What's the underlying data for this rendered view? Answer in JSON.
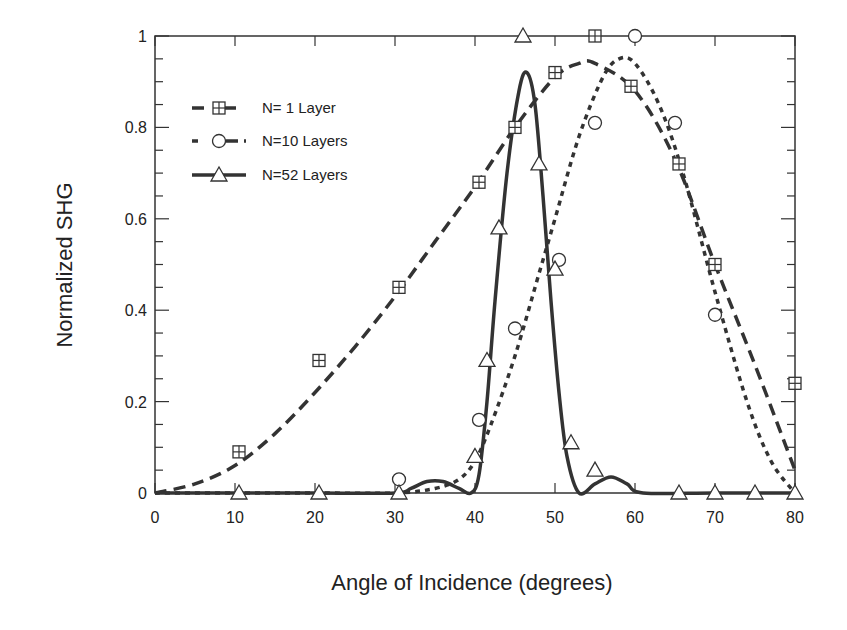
{
  "chart_data": {
    "type": "line",
    "title": "",
    "xlabel": "Angle of Incidence (degrees)",
    "ylabel": "Normalized SHG",
    "xlim": [
      0,
      80
    ],
    "ylim": [
      0,
      1
    ],
    "xticks": [
      0,
      10,
      20,
      30,
      40,
      50,
      60,
      70,
      80
    ],
    "yticks": [
      0,
      0.2,
      0.4,
      0.6,
      0.8,
      1
    ],
    "ytick_labels": [
      "0",
      "0.2",
      "0.4",
      "0.6",
      "0.8",
      "1"
    ],
    "grid": false,
    "legend_position": "upper-left",
    "series": [
      {
        "name": "N= 1 Layer",
        "marker": "square-plus",
        "line_style": "long-dash",
        "points": [
          [
            10.5,
            0.09
          ],
          [
            20.5,
            0.29
          ],
          [
            30.5,
            0.45
          ],
          [
            40.5,
            0.68
          ],
          [
            45,
            0.8
          ],
          [
            50,
            0.92
          ],
          [
            55,
            1.0
          ],
          [
            59.5,
            0.89
          ],
          [
            65.5,
            0.72
          ],
          [
            70,
            0.5
          ],
          [
            80,
            0.24
          ]
        ],
        "fit_curve": [
          [
            0,
            0
          ],
          [
            5,
            0.02
          ],
          [
            10,
            0.06
          ],
          [
            15,
            0.13
          ],
          [
            20,
            0.22
          ],
          [
            25,
            0.32
          ],
          [
            30,
            0.43
          ],
          [
            35,
            0.55
          ],
          [
            40,
            0.67
          ],
          [
            45,
            0.8
          ],
          [
            50,
            0.91
          ],
          [
            53,
            0.94
          ],
          [
            55,
            0.94
          ],
          [
            60,
            0.88
          ],
          [
            65,
            0.73
          ],
          [
            70,
            0.5
          ],
          [
            75,
            0.28
          ],
          [
            80,
            0.05
          ]
        ]
      },
      {
        "name": "N=10 Layers",
        "marker": "circle",
        "line_style": "short-dash",
        "points": [
          [
            30.5,
            0.03
          ],
          [
            40.5,
            0.16
          ],
          [
            45,
            0.36
          ],
          [
            50.5,
            0.51
          ],
          [
            55,
            0.81
          ],
          [
            60,
            1.0
          ],
          [
            65,
            0.81
          ],
          [
            70,
            0.39
          ]
        ],
        "fit_curve": [
          [
            0,
            0
          ],
          [
            10,
            0
          ],
          [
            20,
            0
          ],
          [
            30,
            0
          ],
          [
            35,
            0.01
          ],
          [
            38,
            0.03
          ],
          [
            40,
            0.07
          ],
          [
            42,
            0.15
          ],
          [
            45,
            0.3
          ],
          [
            48,
            0.48
          ],
          [
            50,
            0.6
          ],
          [
            53,
            0.78
          ],
          [
            56,
            0.91
          ],
          [
            58,
            0.95
          ],
          [
            60,
            0.94
          ],
          [
            63,
            0.85
          ],
          [
            66,
            0.7
          ],
          [
            70,
            0.44
          ],
          [
            74,
            0.2
          ],
          [
            77,
            0.07
          ],
          [
            80,
            0
          ]
        ]
      },
      {
        "name": "N=52 Layers",
        "marker": "triangle",
        "line_style": "solid",
        "points": [
          [
            10.5,
            0
          ],
          [
            20.5,
            0
          ],
          [
            30.5,
            0
          ],
          [
            40,
            0.08
          ],
          [
            41.5,
            0.29
          ],
          [
            43,
            0.58
          ],
          [
            46,
            1.0
          ],
          [
            48,
            0.72
          ],
          [
            50,
            0.49
          ],
          [
            52,
            0.11
          ],
          [
            55,
            0.05
          ],
          [
            65.5,
            0
          ],
          [
            70,
            0
          ],
          [
            75,
            0
          ],
          [
            80,
            0
          ]
        ],
        "fit_curve": [
          [
            0,
            0
          ],
          [
            10,
            0
          ],
          [
            20,
            0
          ],
          [
            30,
            0
          ],
          [
            32,
            0.01
          ],
          [
            34,
            0.025
          ],
          [
            36,
            0.025
          ],
          [
            38,
            0.01
          ],
          [
            39.5,
            0
          ],
          [
            40.5,
            0.04
          ],
          [
            41.5,
            0.2
          ],
          [
            42.5,
            0.42
          ],
          [
            44,
            0.7
          ],
          [
            45.5,
            0.88
          ],
          [
            46.5,
            0.92
          ],
          [
            47.5,
            0.85
          ],
          [
            48.5,
            0.65
          ],
          [
            49.5,
            0.42
          ],
          [
            50.5,
            0.22
          ],
          [
            51.5,
            0.08
          ],
          [
            53,
            0
          ],
          [
            55,
            0.02
          ],
          [
            57,
            0.035
          ],
          [
            59,
            0.02
          ],
          [
            61,
            0
          ],
          [
            70,
            0
          ],
          [
            80,
            0
          ]
        ]
      }
    ]
  },
  "axes": {
    "xlabel": "Angle of Incidence (degrees)",
    "ylabel": "Normalized SHG",
    "xtick_labels": [
      "0",
      "10",
      "20",
      "30",
      "40",
      "50",
      "60",
      "70",
      "80"
    ],
    "ytick_labels": [
      "0",
      "0.2",
      "0.4",
      "0.6",
      "0.8",
      "1"
    ]
  },
  "legend": [
    {
      "label": "N= 1 Layer"
    },
    {
      "label": "N=10 Layers"
    },
    {
      "label": "N=52 Layers"
    }
  ]
}
